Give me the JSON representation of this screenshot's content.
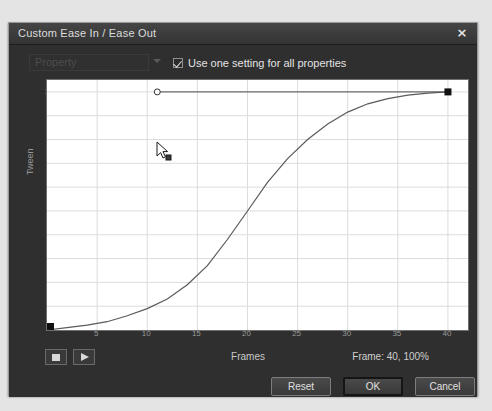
{
  "window": {
    "title": "Custom Ease In / Ease Out",
    "close_icon": "close-icon",
    "close_glyph": "×"
  },
  "property_row": {
    "property_label": "Property",
    "caret_icon": "chevron-down-icon",
    "checkbox_checked": true,
    "checkbox_label": "Use one setting for all properties"
  },
  "graph": {
    "y_axis_title": "Tween",
    "x_axis_title": "Frames"
  },
  "transport": {
    "stop_icon": "stop-icon",
    "play_icon": "play-icon",
    "frames_label": "Frames",
    "readout_label": "Frame:",
    "readout_frame": "40,",
    "readout_percent": "100%"
  },
  "footer": {
    "reset_label": "Reset",
    "ok_label": "OK",
    "cancel_label": "Cancel"
  },
  "colors": {
    "dialog_bg": "#2f2f2f",
    "titlebar": "#3d3d3d",
    "plot_bg": "#ffffff",
    "grid": "#dcdcdc",
    "curve": "#555555",
    "anchor": "#111111"
  },
  "chart_data": {
    "type": "line",
    "title": "",
    "xlabel": "Frames",
    "ylabel": "Tween",
    "xlim": [
      0,
      42
    ],
    "ylim": [
      0,
      105
    ],
    "grid": true,
    "legend": false,
    "xticks": [
      5,
      10,
      15,
      20,
      25,
      30,
      35,
      40
    ],
    "yticks": [
      10,
      20,
      30,
      40,
      50,
      60,
      70,
      80,
      90,
      100
    ],
    "ytick_labels": [
      "10%",
      "20%",
      "30%",
      "40%",
      "50%",
      "60%",
      "70%",
      "80%",
      "90%",
      "100%"
    ],
    "series": [
      {
        "name": "Custom ease curve",
        "x": [
          0,
          2,
          4,
          6,
          8,
          10,
          12,
          14,
          16,
          18,
          20,
          22,
          24,
          26,
          28,
          30,
          32,
          34,
          36,
          38,
          40
        ],
        "y": [
          0,
          1,
          2,
          3.5,
          6,
          9,
          13,
          19,
          27,
          38,
          50,
          62,
          72,
          80,
          86.5,
          91.5,
          95,
          97.2,
          98.6,
          99.5,
          100
        ]
      },
      {
        "name": "Control handle line",
        "x": [
          11,
          40
        ],
        "y": [
          100,
          100
        ]
      }
    ],
    "anchor_points": [
      {
        "name": "start-anchor",
        "x": 0,
        "y": 0,
        "shape": "square",
        "selected": true
      },
      {
        "name": "end-anchor",
        "x": 40,
        "y": 100,
        "shape": "square",
        "selected": true
      },
      {
        "name": "control-point",
        "x": 11,
        "y": 100,
        "shape": "circle",
        "selected": false
      }
    ]
  },
  "cursor": {
    "icon": "mouse-pointer-icon",
    "x": 11,
    "y": 100
  }
}
